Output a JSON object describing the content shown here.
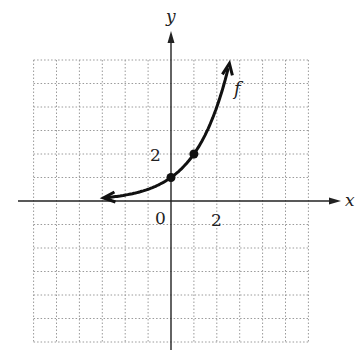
{
  "chart_data": {
    "type": "line",
    "title": "",
    "function_label": "f",
    "function": "f(x) = 2^x",
    "xlabel": "x",
    "ylabel": "y",
    "tick_labels": {
      "x": [
        "0",
        "2"
      ],
      "y": [
        "2"
      ]
    },
    "origin_label": "0",
    "x_tick_label": "2",
    "y_tick_label": "2",
    "grid": true,
    "grid_style": "dotted",
    "xlim": [
      -6,
      6
    ],
    "ylim": [
      -6,
      6
    ],
    "grid_step": 1,
    "curve": {
      "x": [
        -3,
        -2,
        -1,
        0,
        1,
        2,
        2.5
      ],
      "y": [
        0.125,
        0.25,
        0.5,
        1,
        2,
        4,
        5.66
      ]
    },
    "marked_points": [
      {
        "x": 0,
        "y": 1
      },
      {
        "x": 1,
        "y": 2
      }
    ],
    "arrows": {
      "left_end": "toward horizontal asymptote y=0",
      "right_end": "upward"
    },
    "colors": {
      "curve": "#111111",
      "axis": "#222222",
      "grid": "#9a9a9a"
    }
  },
  "labels": {
    "x_axis": "x",
    "y_axis": "y",
    "origin": "0",
    "x_tick": "2",
    "y_tick": "2",
    "function": "f"
  }
}
